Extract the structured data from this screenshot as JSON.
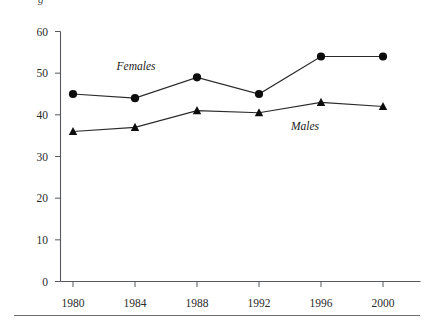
{
  "figure": {
    "clipped_top_text": "g",
    "bottom_rule": true
  },
  "chart_data": {
    "type": "line",
    "title": "",
    "subtitle": "",
    "xlabel": "",
    "ylabel": "",
    "x": [
      "1980",
      "1984",
      "1988",
      "1992",
      "1996",
      "2000"
    ],
    "categories": [
      "1980",
      "1984",
      "1988",
      "1992",
      "1996",
      "2000"
    ],
    "xtick_labels": [
      "1980",
      "1984",
      "1988",
      "1992",
      "1996",
      "2000"
    ],
    "ytick_labels": [
      "0",
      "10",
      "20",
      "30",
      "40",
      "50",
      "60"
    ],
    "ytick_values": [
      0,
      10,
      20,
      30,
      40,
      50,
      60
    ],
    "ylim": [
      0,
      60
    ],
    "grid": false,
    "legend": "inline-annotations",
    "series": [
      {
        "name": "Females",
        "marker": "circle",
        "values": [
          45,
          44,
          49,
          45,
          54,
          54
        ],
        "label_x": "1985",
        "label_value": 52
      },
      {
        "name": "Males",
        "marker": "triangle",
        "values": [
          36,
          37,
          41,
          40.5,
          43,
          42
        ],
        "label_x": "1993",
        "label_value": 34
      }
    ],
    "annotations": [
      {
        "text": "Females",
        "x": 136,
        "y": 70
      },
      {
        "text": "Males",
        "x": 305,
        "y": 130
      }
    ],
    "colors": {
      "marker": "#0d0d0d",
      "line": "#2a2a2a",
      "axis": "#55585c",
      "text": "#2b2b2b",
      "background": "#ffffff"
    }
  }
}
